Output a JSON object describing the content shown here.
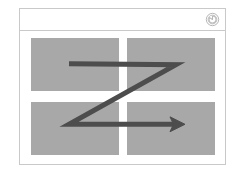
{
  "canvas": {
    "width": 245,
    "height": 176,
    "background": "#ffffff"
  },
  "frame": {
    "name": "wireframe-card",
    "border_color": "#c9c9c9",
    "background": "#ffffff"
  },
  "header": {
    "title": "",
    "icon": "refresh-spiral-icon",
    "icon_color": "#b8b8b8",
    "divider_color": "#c9c9c9"
  },
  "content": {
    "placeholder_color": "#a8a8a8",
    "blocks": [
      {
        "id": "top-left",
        "label": ""
      },
      {
        "id": "top-right",
        "label": ""
      },
      {
        "id": "bottom-left",
        "label": ""
      },
      {
        "id": "bottom-right",
        "label": ""
      }
    ]
  },
  "annotation": {
    "type": "z-pattern-arrow",
    "color": "#4d4d4d",
    "stroke_width": 5,
    "points": [
      {
        "x": 49,
        "y": 33
      },
      {
        "x": 156,
        "y": 34
      },
      {
        "x": 49,
        "y": 94
      },
      {
        "x": 161,
        "y": 94
      }
    ],
    "arrowhead": "right"
  }
}
